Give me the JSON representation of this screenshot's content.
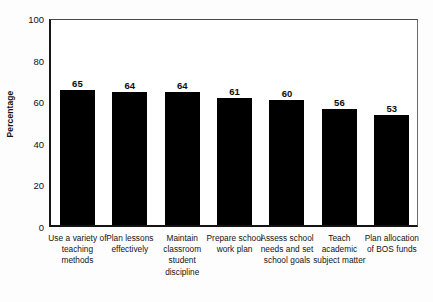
{
  "chart_data": {
    "type": "bar",
    "title": "",
    "xlabel": "",
    "ylabel": "Percentage",
    "ylim": [
      0,
      100
    ],
    "yticks": [
      0,
      20,
      40,
      60,
      80,
      100
    ],
    "grid": false,
    "legend": null,
    "bar_color": "#000000",
    "categories": [
      "Use a variety of teaching methods",
      "Plan lessons effectively",
      "Maintain classroom student discipline",
      "Prepare school work plan",
      "Assess school needs and set school goals",
      "Teach academic subject matter",
      "Plan allocation of BOS funds"
    ],
    "values": [
      65,
      64,
      64,
      61,
      60,
      56,
      53
    ],
    "value_labels": [
      "65",
      "64",
      "64",
      "61",
      "60",
      "56",
      "53"
    ],
    "ytick_labels": [
      "0",
      "20",
      "40",
      "60",
      "80",
      "100"
    ]
  }
}
